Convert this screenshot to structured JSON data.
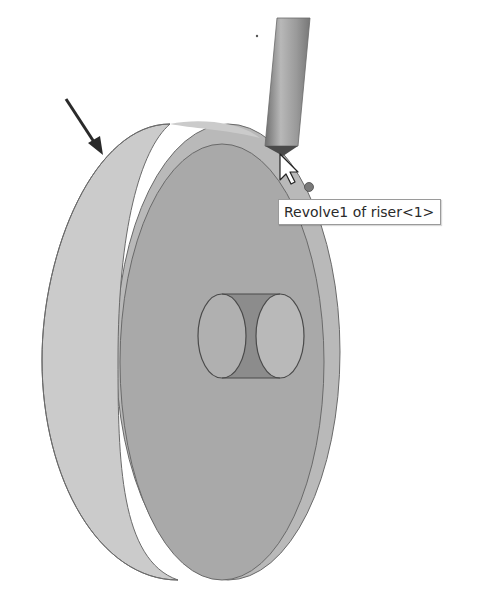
{
  "viewport": {
    "model": "riser disc with through-hole",
    "colors": {
      "background": "#ffffff",
      "rim_face": "#c9c9c9",
      "front_face": "#a8a8a8",
      "back_face": "#b7b7b7",
      "edge": "#6a6a6a",
      "hole_inner": "#8a8a8a",
      "tool": "#9b9b9b"
    }
  },
  "tooltip": {
    "text": "Revolve1 of riser<1>"
  },
  "annotation": {
    "arrow": "pointer-arrow to rim face"
  }
}
